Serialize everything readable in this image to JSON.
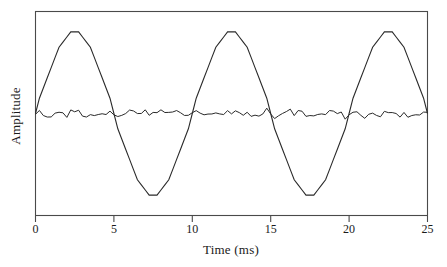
{
  "figure": {
    "background_color": "#ffffff",
    "line_color": "#2a2a2a",
    "frame_color": "#4a4a4a"
  },
  "axes": {
    "x_title": "Time (ms)",
    "y_title": "Amplitude",
    "x_tick_labels": [
      "0",
      "5",
      "10",
      "15",
      "20",
      "25"
    ],
    "y_tick_labels": []
  },
  "chart_data": {
    "type": "line",
    "title": "",
    "subtitle": "",
    "xlabel": "Time (ms)",
    "ylabel": "Amplitude",
    "xlim": [
      0,
      25
    ],
    "ylim": [
      -1.25,
      1.25
    ],
    "xticks": [
      0,
      5,
      10,
      15,
      20,
      25
    ],
    "yticks": [],
    "grid": false,
    "legend": null,
    "legend_position": "none",
    "annotations": [],
    "series": [
      {
        "name": "quantized-sine",
        "waveform": "sine",
        "amplitude": 1.0,
        "offset": 0.0,
        "period_ms": 10,
        "frequency_hz": 100,
        "phase_deg": 0,
        "cycles": 3,
        "quantized": true,
        "quantization_steps": 16,
        "sample_interval_ms": 0.25,
        "peak_times_ms": [
          2.5,
          12.5,
          22.5
        ],
        "trough_times_ms": [
          7.5,
          17.5
        ],
        "zero_crossing_times_ms": [
          0,
          5,
          10,
          15,
          20,
          25
        ]
      },
      {
        "name": "quantization-noise",
        "waveform": "noise",
        "amplitude": 0.055,
        "offset": 0.0,
        "mean": 0.0,
        "quantized": true,
        "sample_interval_ms": 0.25,
        "description": "High-frequency residual error oscillating about zero"
      }
    ],
    "x": [
      0,
      2.5,
      5,
      7.5,
      10,
      12.5,
      15,
      17.5,
      20,
      22.5,
      25
    ],
    "y": [
      0,
      1,
      0,
      -1,
      0,
      1,
      0,
      -1,
      0,
      1,
      0
    ]
  }
}
